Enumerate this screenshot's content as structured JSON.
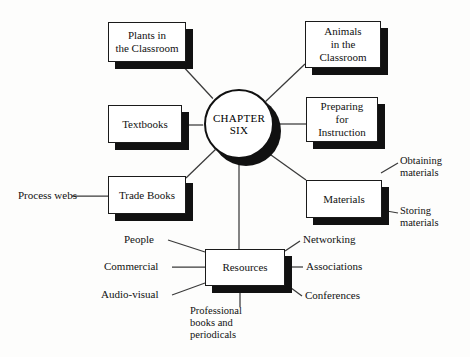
{
  "diagram": {
    "hub": {
      "name": "chapter-hub",
      "line1": "CHAPTER",
      "line2": "SIX"
    },
    "nodes": [
      {
        "id": "plants",
        "label": "Plants in\nthe Classroom"
      },
      {
        "id": "animals",
        "label": "Animals\nin the\nClassroom"
      },
      {
        "id": "textbooks",
        "label": "Textbooks"
      },
      {
        "id": "preparing",
        "label": "Preparing\nfor\nInstruction"
      },
      {
        "id": "trade",
        "label": "Trade Books"
      },
      {
        "id": "materials",
        "label": "Materials"
      },
      {
        "id": "resources",
        "label": "Resources"
      }
    ],
    "leaves": [
      {
        "id": "process-webs",
        "label": "Process webs"
      },
      {
        "id": "obtaining",
        "label": "Obtaining\nmaterials"
      },
      {
        "id": "storing",
        "label": "Storing\nmaterials"
      },
      {
        "id": "people",
        "label": "People"
      },
      {
        "id": "commercial",
        "label": "Commercial"
      },
      {
        "id": "audio-visual",
        "label": "Audio-visual"
      },
      {
        "id": "networking",
        "label": "Networking"
      },
      {
        "id": "associations",
        "label": "Associations"
      },
      {
        "id": "conferences",
        "label": "Conferences"
      },
      {
        "id": "professional",
        "label": "Professional\nbooks and\nperiodicals"
      }
    ],
    "colors": {
      "ink": "#111111",
      "paper": "#fdfdfc",
      "shadow": "#111111"
    }
  }
}
